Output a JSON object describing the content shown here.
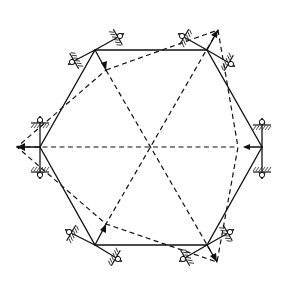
{
  "diagram": {
    "title": "",
    "center": [
      151,
      147
    ],
    "solid_hexagon": [
      [
        95,
        50
      ],
      [
        207,
        50
      ],
      [
        262,
        147
      ],
      [
        207,
        245
      ],
      [
        95,
        245
      ],
      [
        40,
        147
      ]
    ],
    "dashed_polygon": [
      [
        106,
        70
      ],
      [
        218,
        30
      ],
      [
        238,
        147
      ],
      [
        217,
        262
      ],
      [
        106,
        224
      ],
      [
        17,
        147
      ]
    ],
    "dashed_diagonals": [
      [
        [
          106,
          70
        ],
        [
          217,
          262
        ]
      ],
      [
        [
          218,
          30
        ],
        [
          106,
          224
        ]
      ],
      [
        [
          17,
          147
        ],
        [
          238,
          147
        ]
      ]
    ],
    "displacement_arrows": [
      {
        "from": [
          95,
          50
        ],
        "to": [
          106,
          70
        ]
      },
      {
        "from": [
          207,
          50
        ],
        "to": [
          218,
          30
        ]
      },
      {
        "from": [
          262,
          147
        ],
        "to": [
          245,
          147
        ]
      },
      {
        "from": [
          207,
          245
        ],
        "to": [
          217,
          262
        ]
      },
      {
        "from": [
          95,
          245
        ],
        "to": [
          106,
          224
        ]
      },
      {
        "from": [
          40,
          147
        ],
        "to": [
          17,
          147
        ]
      }
    ],
    "supports": [
      {
        "name": "support-top-left-a",
        "joint": [
          95,
          50
        ],
        "pin": [
          72,
          62
        ],
        "ground_angle": -30
      },
      {
        "name": "support-top-left-b",
        "joint": [
          95,
          50
        ],
        "pin": [
          120,
          36
        ],
        "ground_angle": 150
      },
      {
        "name": "support-top-right-a",
        "joint": [
          207,
          50
        ],
        "pin": [
          182,
          36
        ],
        "ground_angle": 30
      },
      {
        "name": "support-top-right-b",
        "joint": [
          207,
          50
        ],
        "pin": [
          231,
          64
        ],
        "ground_angle": 210
      },
      {
        "name": "support-left-top",
        "joint": [
          40,
          147
        ],
        "pin": [
          40,
          120
        ],
        "ground_angle": 0
      },
      {
        "name": "support-left-bottom",
        "joint": [
          40,
          147
        ],
        "pin": [
          40,
          175
        ],
        "ground_angle": 180
      },
      {
        "name": "support-right-top",
        "joint": [
          262,
          147
        ],
        "pin": [
          262,
          122
        ],
        "ground_angle": 0
      },
      {
        "name": "support-right-bottom",
        "joint": [
          262,
          147
        ],
        "pin": [
          262,
          175
        ],
        "ground_angle": 180
      },
      {
        "name": "support-bottom-left-a",
        "joint": [
          95,
          245
        ],
        "pin": [
          69,
          232
        ],
        "ground_angle": 30
      },
      {
        "name": "support-bottom-left-b",
        "joint": [
          95,
          245
        ],
        "pin": [
          118,
          259
        ],
        "ground_angle": 210
      },
      {
        "name": "support-bottom-right-a",
        "joint": [
          207,
          245
        ],
        "pin": [
          230,
          232
        ],
        "ground_angle": 150
      },
      {
        "name": "support-bottom-right-b",
        "joint": [
          207,
          245
        ],
        "pin": [
          183,
          259
        ],
        "ground_angle": -30
      }
    ],
    "colors": {
      "line": "#111111",
      "background": "#ffffff"
    }
  }
}
